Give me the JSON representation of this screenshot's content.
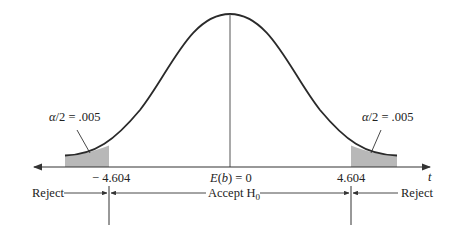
{
  "diagram": {
    "type": "t-distribution two-tailed rejection regions",
    "axis_variable": "t",
    "center_label": "E(b) = 0",
    "center_label_parts": {
      "e": "E",
      "open": "(",
      "b": "b",
      "close": ") = 0"
    },
    "left_critical": "− 4.604",
    "right_critical": "4.604",
    "left_tail_label": "α/2 = .005",
    "right_tail_label": "α/2 = .005",
    "tail_label_parts": {
      "alpha": "α",
      "rest": "/2 = .005"
    },
    "regions": {
      "left": "Reject",
      "middle": "Accept H",
      "middle_sub": "0",
      "right": "Reject"
    },
    "colors": {
      "curve": "#2a2a2a",
      "shade": "#b8b8b8",
      "lines": "#333333"
    }
  }
}
